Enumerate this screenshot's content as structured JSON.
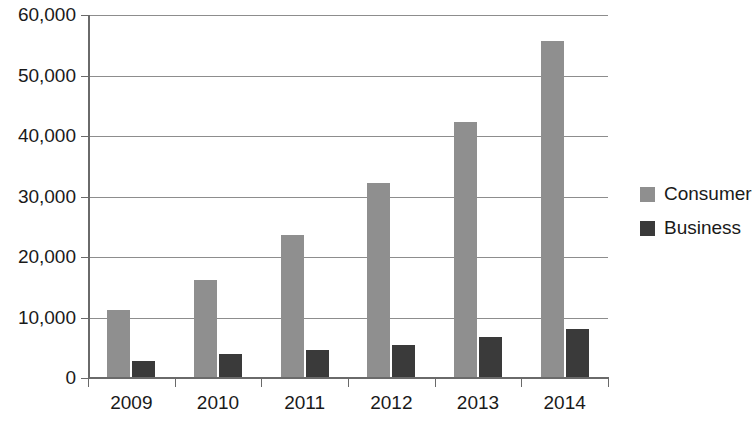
{
  "chart_data": {
    "type": "bar",
    "title": "",
    "subtitle": "",
    "xlabel": "",
    "ylabel": "",
    "categories": [
      "2009",
      "2010",
      "2011",
      "2012",
      "2013",
      "2014"
    ],
    "series": [
      {
        "name": "Consumer",
        "color": "#8f8f8f",
        "values": [
          11300,
          16200,
          23700,
          32300,
          42300,
          55700
        ]
      },
      {
        "name": "Business",
        "color": "#3a3a3a",
        "values": [
          2800,
          4000,
          4700,
          5500,
          6800,
          8100
        ]
      }
    ],
    "ylim": [
      0,
      60000
    ],
    "ytick_values": [
      0,
      10000,
      20000,
      30000,
      40000,
      50000,
      60000
    ],
    "ytick_labels": [
      "0",
      "10,000",
      "20,000",
      "30,000",
      "40,000",
      "50,000",
      "60,000"
    ],
    "grid": true,
    "grid_axis": "y",
    "legend_position": "right",
    "legend": [
      "Consumer",
      "Business"
    ],
    "annotations": []
  },
  "colors": {
    "consumer": "#8f8f8f",
    "business": "#3a3a3a",
    "axis": "#6a6a6a",
    "grid": "#8d8d8d",
    "background": "#ffffff",
    "text": "#1a1a1a"
  }
}
